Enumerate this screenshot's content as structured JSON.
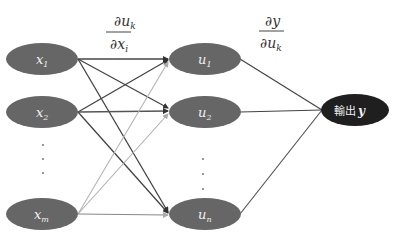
{
  "diagram": {
    "formula_left": {
      "numerator_main": "∂u",
      "numerator_sub": "k",
      "denominator_main": "∂x",
      "denominator_sub": "i"
    },
    "formula_right": {
      "numerator_main": "∂y",
      "denominator_main": "∂u",
      "denominator_sub": "k"
    },
    "input_nodes": [
      {
        "main": "x",
        "sub": "1"
      },
      {
        "main": "x",
        "sub": "2"
      },
      {
        "main": "x",
        "sub": "m"
      }
    ],
    "hidden_nodes": [
      {
        "main": "u",
        "sub": "1"
      },
      {
        "main": "u",
        "sub": "2"
      },
      {
        "main": "u",
        "sub": "n"
      }
    ],
    "output_node": {
      "label": "輸出",
      "var": "y"
    },
    "colors": {
      "node_fill": "#666666",
      "output_fill": "#1f1f1f",
      "edge_dark": "#444444",
      "edge_medium": "#888888",
      "edge_light": "#b5b5b5"
    }
  }
}
